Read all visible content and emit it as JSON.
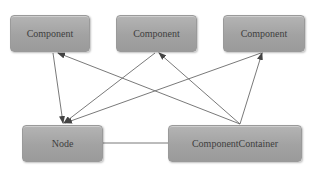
{
  "diagram": {
    "nodes": [
      {
        "id": "component-1",
        "label": "Component",
        "x": 10,
        "y": 15,
        "w": 80,
        "h": 37
      },
      {
        "id": "component-2",
        "label": "Component",
        "x": 116,
        "y": 15,
        "w": 81,
        "h": 37
      },
      {
        "id": "component-3",
        "label": "Component",
        "x": 223,
        "y": 15,
        "w": 82,
        "h": 37
      },
      {
        "id": "node",
        "label": "Node",
        "x": 22,
        "y": 125,
        "w": 81,
        "h": 37
      },
      {
        "id": "component-container",
        "label": "ComponentContainer",
        "x": 168,
        "y": 125,
        "w": 134,
        "h": 37
      }
    ],
    "edges": [
      {
        "from": "component-1",
        "to": "node",
        "arrow": "end"
      },
      {
        "from": "component-container",
        "to": "component-1",
        "arrow": "end"
      },
      {
        "from": "component-2",
        "to": "node",
        "arrow": "end"
      },
      {
        "from": "component-container",
        "to": "component-2",
        "arrow": "end"
      },
      {
        "from": "component-3",
        "to": "node",
        "arrow": "end"
      },
      {
        "from": "component-container",
        "to": "component-3",
        "arrow": "end"
      },
      {
        "from": "node",
        "to": "component-container",
        "arrow": "none"
      }
    ],
    "colors": {
      "box_fill": "#a8a8a8",
      "box_border": "#9a9a9a",
      "text": "#3e3e3e",
      "edge": "#6a6a6a"
    }
  }
}
